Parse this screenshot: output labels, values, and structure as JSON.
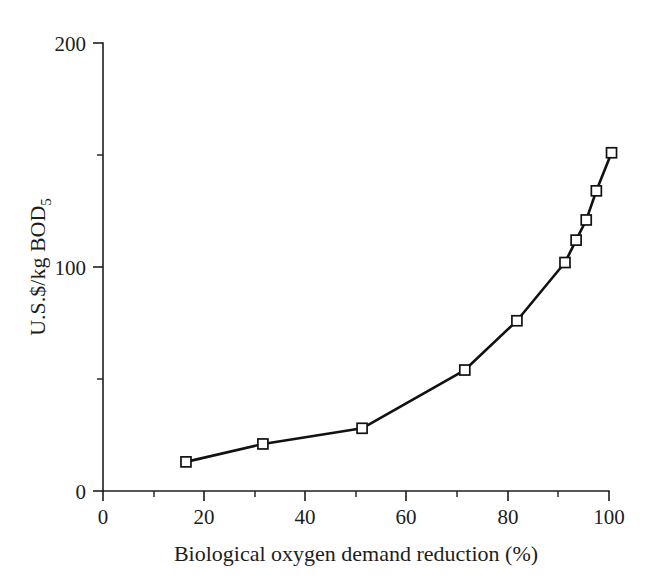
{
  "chart_data": {
    "type": "line",
    "title": "",
    "subtitle": "",
    "xlabel": "Biological oxygen demand reduction (%)",
    "ylabel": "U.S.$/kg BOD",
    "ylabel_subscript": "5",
    "xlim": [
      0,
      100
    ],
    "ylim": [
      0,
      200
    ],
    "grid": false,
    "legend": "none",
    "marker_style": "open-square",
    "line_color": "#111111",
    "marker_fill_color": "#ffffff",
    "x_ticks_major": [
      0,
      20,
      40,
      60,
      80,
      100
    ],
    "x_tick_labels": [
      "0",
      "20",
      "40",
      "60",
      "80",
      "100"
    ],
    "x_ticks_minor": [
      10,
      30,
      50,
      70,
      90
    ],
    "y_ticks_major": [
      0,
      100,
      200
    ],
    "y_tick_labels": [
      "0",
      "100",
      "200"
    ],
    "y_ticks_minor": [
      50,
      150
    ],
    "series": [
      {
        "name": "Treatment cost",
        "x": [
          16.4,
          31.6,
          51.2,
          71.5,
          81.8,
          91.3,
          93.5,
          95.5,
          97.5,
          100.5
        ],
        "values": [
          13,
          21,
          28,
          54,
          76,
          102,
          112,
          121,
          134,
          151
        ]
      }
    ]
  }
}
